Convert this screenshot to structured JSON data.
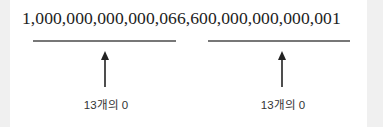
{
  "diagram": {
    "number_text": "1,000,000,000,000,066,600,000,000,000,001",
    "segments": [
      {
        "label": "13개의 0",
        "covers": "000,000,000,000,0"
      },
      {
        "label": "13개의 0",
        "covers": "00,000,000,000,00"
      }
    ],
    "colors": {
      "text": "#222222",
      "underline": "#777777",
      "arrow": "#222222",
      "side_band": "#f0f0f0"
    }
  }
}
